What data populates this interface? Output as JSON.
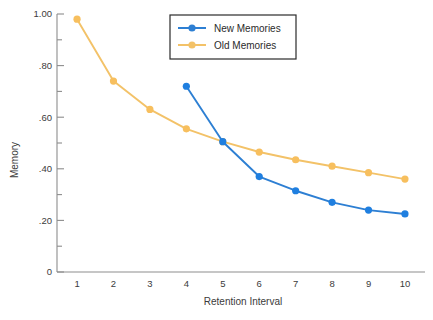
{
  "chart_data": {
    "type": "line",
    "title": "",
    "xlabel": "Retention Interval",
    "ylabel": "Memory",
    "x": [
      1,
      2,
      3,
      4,
      5,
      6,
      7,
      8,
      9,
      10
    ],
    "xlim": [
      0.45,
      10.55
    ],
    "ylim": [
      0,
      1.0
    ],
    "grid": false,
    "legend_position": "top-center",
    "y_tick_labels": [
      "1.00",
      ".80",
      ".60",
      ".40",
      ".20",
      "0"
    ],
    "y_tick_values": [
      1.0,
      0.8,
      0.6,
      0.4,
      0.2,
      0
    ],
    "y_minor_tick_values": [
      0.9,
      0.7,
      0.5,
      0.3,
      0.1
    ],
    "x_tick_labels": [
      "1",
      "2",
      "3",
      "4",
      "5",
      "6",
      "7",
      "8",
      "9",
      "10"
    ],
    "series": [
      {
        "name": "New Memories",
        "color": "#2d7fd3",
        "marker_color": "#1f7fe0",
        "x": [
          4,
          5,
          6,
          7,
          8,
          9,
          10
        ],
        "values": [
          0.72,
          0.505,
          0.37,
          0.315,
          0.27,
          0.24,
          0.225
        ]
      },
      {
        "name": "Old Memories",
        "color": "#f3c268",
        "marker_color": "#f7bf5e",
        "x": [
          1,
          2,
          3,
          4,
          5,
          6,
          7,
          8,
          9,
          10
        ],
        "values": [
          0.98,
          0.74,
          0.63,
          0.555,
          0.505,
          0.465,
          0.435,
          0.41,
          0.385,
          0.36
        ]
      }
    ]
  },
  "legend": {
    "entries": [
      {
        "label": "New Memories",
        "color": "#2d7fd3"
      },
      {
        "label": "Old Memories",
        "color": "#f3c268"
      }
    ]
  },
  "axes": {
    "y_title": "Memory",
    "x_title": "Retention Interval"
  }
}
